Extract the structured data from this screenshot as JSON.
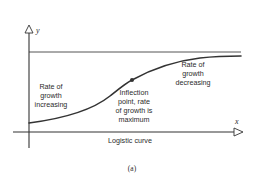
{
  "figure": {
    "caption": "Logistic curve",
    "panel_label": "(a)",
    "axes": {
      "x_label": "x",
      "y_label": "y"
    },
    "annotations": {
      "left": [
        "Rate of",
        "growth",
        "increasing"
      ],
      "inflection": [
        "Inflection",
        "point, rate",
        "of growth is",
        "maximum"
      ],
      "right": [
        "Rate of",
        "growth",
        "decreasing"
      ]
    },
    "colors": {
      "stroke": "#333333",
      "asymptote": "#555555",
      "text": "#2b2b2b"
    }
  }
}
